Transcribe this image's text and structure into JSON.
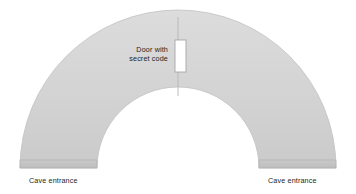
{
  "diagram": {
    "background_color": "#ffffff",
    "arch": {
      "fill_color": "#d4d4d4",
      "stroke_color": "#bfbfbf",
      "center_x": 178,
      "baseline_y": 168,
      "outer_radius": 158,
      "inner_radius": 81
    },
    "center_line": {
      "color": "#b3b3b3",
      "x": 178,
      "y_top": 17,
      "y_bottom": 96
    },
    "door": {
      "label_line_1": "Door with",
      "label_line_2": "secret code",
      "fill_color": "#ffffff",
      "stroke_color": "#a6a6a6",
      "x": 175,
      "y": 40,
      "width": 11,
      "height": 32
    },
    "entrances": [
      {
        "label": "Cave entrance",
        "side": "left",
        "strip_color": "#c4c4c4",
        "strip_x": 20,
        "strip_y": 160,
        "strip_width": 77,
        "strip_height": 8
      },
      {
        "label": "Cave entrance",
        "side": "right",
        "strip_color": "#c4c4c4",
        "strip_x": 259,
        "strip_y": 160,
        "strip_width": 77,
        "strip_height": 8
      }
    ],
    "text_color": "#231f20"
  }
}
